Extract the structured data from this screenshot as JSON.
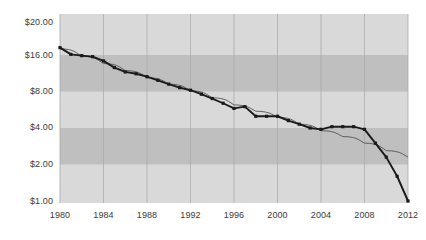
{
  "chart_data": {
    "type": "line",
    "title": "",
    "subtitle": "",
    "xlabel": "",
    "ylabel": "",
    "yscale": "log",
    "ylim": [
      1.0,
      20.0
    ],
    "xlim": [
      1980,
      2012
    ],
    "grid": {
      "vertical": true,
      "horizontal": false,
      "alternating_bands": true
    },
    "legend": {
      "position": "none",
      "entries": []
    },
    "y_ticks": [
      20.0,
      16.0,
      8.0,
      4.0,
      2.0,
      1.0
    ],
    "y_tick_labels": [
      "$20.00",
      "$16.00",
      "$8.00",
      "$4.00",
      "$2.00",
      "$1.00"
    ],
    "x_ticks": [
      1980,
      1984,
      1988,
      1992,
      1996,
      2000,
      2004,
      2008,
      2012
    ],
    "x_tick_labels": [
      "1980",
      "1984",
      "1988",
      "1992",
      "1996",
      "2000",
      "2004",
      "2008",
      "2012"
    ],
    "bands": [
      {
        "from": 16.0,
        "to": 8.0,
        "shade": "dark"
      },
      {
        "from": 4.0,
        "to": 2.0,
        "shade": "dark"
      }
    ],
    "series": [
      {
        "name": "price",
        "style": "line-with-square-markers",
        "color": "#1a1a1a",
        "x": [
          1980,
          1981,
          1982,
          1983,
          1984,
          1985,
          1986,
          1987,
          1988,
          1989,
          1990,
          1991,
          1992,
          1993,
          1994,
          1995,
          1996,
          1997,
          1998,
          1999,
          2000,
          2001,
          2002,
          2003,
          2004,
          2005,
          2006,
          2007,
          2008,
          2009,
          2010,
          2011,
          2012
        ],
        "values": [
          18.4,
          16.2,
          15.8,
          15.5,
          14.3,
          12.6,
          11.6,
          11.2,
          10.6,
          9.9,
          9.2,
          8.6,
          8.2,
          7.6,
          7.0,
          6.4,
          5.8,
          6.0,
          5.0,
          5.0,
          5.0,
          4.6,
          4.3,
          4.0,
          3.9,
          4.1,
          4.1,
          4.1,
          3.9,
          3.0,
          2.3,
          1.6,
          1.0
        ]
      },
      {
        "name": "trend",
        "style": "thin-smooth-line",
        "color": "#555555",
        "x": [
          1980,
          1982,
          1984,
          1986,
          1988,
          1990,
          1992,
          1994,
          1996,
          1998,
          2000,
          2002,
          2004,
          2006,
          2008,
          2010,
          2012
        ],
        "values": [
          18.0,
          15.6,
          13.6,
          11.9,
          10.4,
          9.2,
          8.1,
          7.1,
          6.2,
          5.5,
          4.9,
          4.3,
          3.8,
          3.4,
          3.0,
          2.6,
          2.3
        ]
      }
    ]
  },
  "axis": {
    "y_label_0": "$20.00",
    "y_label_1": "$16.00",
    "y_label_2": "$8.00",
    "y_label_3": "$4.00",
    "y_label_4": "$2.00",
    "y_label_5": "$1.00",
    "x_label_0": "1980",
    "x_label_1": "1984",
    "x_label_2": "1988",
    "x_label_3": "1992",
    "x_label_4": "1996",
    "x_label_5": "2000",
    "x_label_6": "2004",
    "x_label_7": "2008",
    "x_label_8": "2012"
  },
  "colors": {
    "background": "#ffffff",
    "plot_light_band": "#d9d9d9",
    "plot_dark_band": "#bfbfbf",
    "gridline": "#a8a8a8",
    "series_line": "#1a1a1a",
    "trend_line": "#555555",
    "tick_text": "#3a3a3a"
  }
}
